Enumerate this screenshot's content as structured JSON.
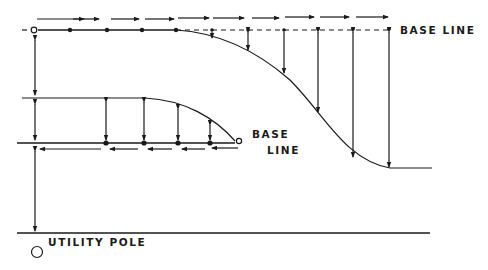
{
  "labels": {
    "top_base_line": "BASE LINE",
    "lower_base_line_1": "BASE",
    "lower_base_line_2": "LINE",
    "utility_pole": "UTILITY POLE"
  },
  "colors": {
    "ink": "#1a1a1a",
    "background": "#ffffff"
  },
  "top_row": {
    "dot_x": [
      70,
      107,
      142,
      176,
      212,
      248,
      284,
      318,
      353,
      389
    ],
    "arrow_segments": [
      [
        37,
        84
      ],
      [
        73,
        99
      ],
      [
        111,
        139
      ],
      [
        145,
        174
      ],
      [
        178,
        209
      ],
      [
        213,
        244
      ],
      [
        252,
        279
      ],
      [
        285,
        314
      ],
      [
        320,
        349
      ],
      [
        356,
        388
      ]
    ]
  },
  "lower_row": {
    "dot_x": [
      106,
      144,
      178,
      210
    ],
    "arrow_segments": [
      [
        40,
        101
      ],
      [
        110,
        138
      ],
      [
        148,
        172
      ],
      [
        182,
        205
      ],
      [
        212,
        238
      ]
    ]
  }
}
